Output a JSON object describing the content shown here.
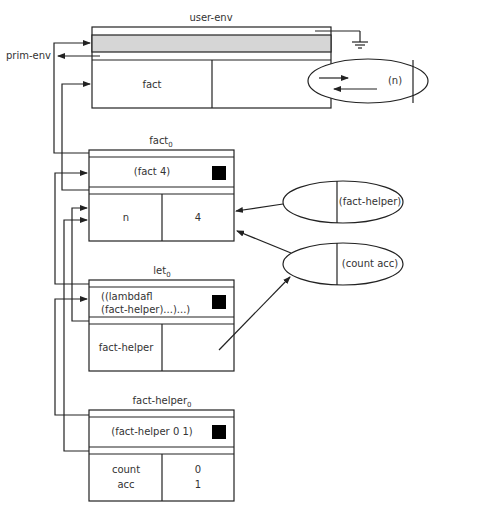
{
  "diagram": {
    "colors": {
      "line": "#222222",
      "shade": "#d6d6d6",
      "text": "#333333",
      "marker": "#000000"
    },
    "external_label": "prim-env",
    "frames": [
      {
        "id": "user-env",
        "title": "user-env",
        "title_sub": "",
        "bindings": [
          {
            "name": "fact",
            "value": ""
          }
        ]
      },
      {
        "id": "fact0",
        "title": "fact",
        "title_sub": "0",
        "expression": "(fact 4)",
        "bindings": [
          {
            "name": "n",
            "value": "4"
          }
        ]
      },
      {
        "id": "let0",
        "title": "let",
        "title_sub": "0",
        "expression_line1": "((lambdafl",
        "expression_line2": "(fact-helper)...)...)",
        "bindings": [
          {
            "name": "fact-helper",
            "value": ""
          }
        ]
      },
      {
        "id": "fact-helper0",
        "title": "fact-helper",
        "title_sub": "0",
        "expression": "(fact-helper 0 1)",
        "bindings": [
          {
            "name_line1": "count",
            "name_line2": "acc",
            "value_line1": "0",
            "value_line2": "1"
          }
        ]
      }
    ],
    "closures": [
      {
        "id": "closure-n",
        "params": "(n)"
      },
      {
        "id": "closure-fact-helper",
        "params": "(fact-helper)"
      },
      {
        "id": "closure-count-acc",
        "params": "(count acc)"
      }
    ]
  }
}
